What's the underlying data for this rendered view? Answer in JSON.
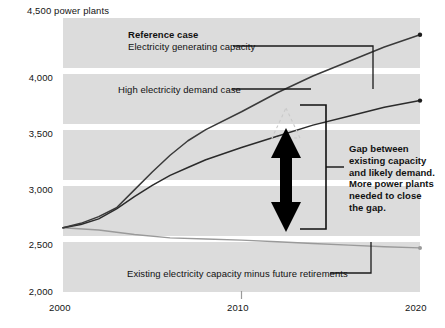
{
  "chart_data": {
    "type": "line",
    "title": "",
    "xlabel": "",
    "ylabel": "power plants",
    "unit_label": "4,500 power plants",
    "xlim": [
      2000,
      2020
    ],
    "ylim": [
      2000,
      4500
    ],
    "yticks": [
      2000,
      2500,
      3000,
      3500,
      4000,
      4500
    ],
    "ytick_labels": [
      "2,000",
      "2,500",
      "3,000",
      "3,500",
      "4,000",
      "4,500"
    ],
    "xticks": [
      2000,
      2010,
      2020
    ],
    "xtick_labels": [
      "2000",
      "2010",
      "2020"
    ],
    "grid": true,
    "legend_position": "inline-annotations",
    "series": [
      {
        "name": "Reference case: Electricity generating capacity",
        "color": "#3a3a3a",
        "x": [
          2000,
          2001,
          2002,
          2003,
          2004,
          2005,
          2006,
          2007,
          2008,
          2010,
          2012,
          2014,
          2016,
          2018,
          2020
        ],
        "values": [
          2620,
          2660,
          2720,
          2800,
          2960,
          3120,
          3270,
          3400,
          3500,
          3660,
          3830,
          3980,
          4110,
          4240,
          4350
        ]
      },
      {
        "name": "High electricity demand case",
        "color": "#2b2b2b",
        "x": [
          2000,
          2001,
          2002,
          2003,
          2004,
          2005,
          2006,
          2007,
          2008,
          2010,
          2012,
          2014,
          2016,
          2018,
          2020
        ],
        "values": [
          2620,
          2650,
          2700,
          2790,
          2900,
          3000,
          3090,
          3160,
          3230,
          3340,
          3440,
          3540,
          3620,
          3700,
          3760
        ]
      },
      {
        "name": "Existing electricity capacity minus future retirements",
        "color": "#8f8f8f",
        "x": [
          2000,
          2002,
          2004,
          2006,
          2008,
          2010,
          2012,
          2014,
          2016,
          2018,
          2020
        ],
        "values": [
          2620,
          2600,
          2560,
          2530,
          2520,
          2510,
          2495,
          2480,
          2465,
          2450,
          2440
        ]
      }
    ],
    "annotations": [
      {
        "id": "reference-case-title",
        "text": "Reference case",
        "bold": true
      },
      {
        "id": "reference-case-sub",
        "text": "Electricity generating capacity",
        "bold": false
      },
      {
        "id": "high-demand-label",
        "text": "High electricity demand case",
        "bold": false
      },
      {
        "id": "existing-capacity-label",
        "text": "Existing electricity capacity minus future retirements",
        "bold": false
      }
    ],
    "gap_note_lines": [
      "Gap between",
      "existing capacity",
      "and likely demand.",
      "More power plants",
      "needed to close",
      "the gap."
    ],
    "gap_arrow": {
      "year": 2012,
      "top_value": 3470,
      "bottom_value": 2500,
      "direction": "double"
    }
  },
  "colors": {
    "band": "#dcdcdc",
    "background": "#ffffff",
    "text": "#111111",
    "reference_line": "#3a3a3a",
    "high_demand_line": "#2b2b2b",
    "existing_line": "#8f8f8f",
    "arrow": "#000000"
  }
}
